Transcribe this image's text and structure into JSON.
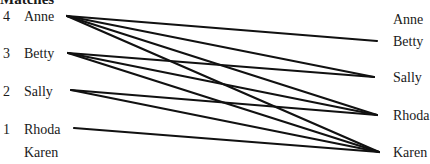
{
  "title": "Matches",
  "left": [
    {
      "rank": "4",
      "name": "Anne"
    },
    {
      "rank": "3",
      "name": "Betty"
    },
    {
      "rank": "2",
      "name": "Sally"
    },
    {
      "rank": "1",
      "name": "Rhoda"
    },
    {
      "rank": "",
      "name": "Karen"
    }
  ],
  "right": [
    {
      "name": "Anne"
    },
    {
      "name": "Betty"
    },
    {
      "name": "Sally"
    },
    {
      "name": "Rhoda"
    },
    {
      "name": "Karen"
    }
  ],
  "edges": [
    {
      "from": "Anne",
      "to": "Betty"
    },
    {
      "from": "Anne",
      "to": "Sally"
    },
    {
      "from": "Anne",
      "to": "Rhoda"
    },
    {
      "from": "Anne",
      "to": "Karen"
    },
    {
      "from": "Betty",
      "to": "Sally"
    },
    {
      "from": "Betty",
      "to": "Rhoda"
    },
    {
      "from": "Betty",
      "to": "Karen"
    },
    {
      "from": "Sally",
      "to": "Rhoda"
    },
    {
      "from": "Sally",
      "to": "Karen"
    },
    {
      "from": "Rhoda",
      "to": "Karen"
    }
  ]
}
